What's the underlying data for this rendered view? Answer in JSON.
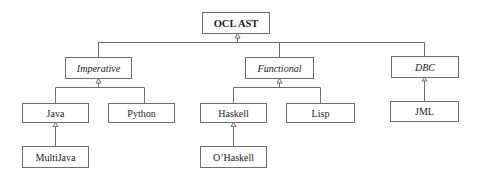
{
  "diagram": {
    "type": "class-inheritance-tree",
    "nodes": {
      "root": {
        "label": "OCL AST",
        "style": "bold"
      },
      "imperative": {
        "label": "Imperative",
        "style": "italic"
      },
      "functional": {
        "label": "Functional",
        "style": "italic"
      },
      "dbc": {
        "label": "DBC",
        "style": "italic"
      },
      "java": {
        "label": "Java"
      },
      "python": {
        "label": "Python"
      },
      "haskell": {
        "label": "Haskell"
      },
      "lisp": {
        "label": "Lisp"
      },
      "jml": {
        "label": "JML"
      },
      "multijava": {
        "label": "MultiJava"
      },
      "ohaskell": {
        "label": "O’Haskell"
      }
    },
    "edges": [
      {
        "from": "imperative",
        "to": "root",
        "kind": "generalization"
      },
      {
        "from": "functional",
        "to": "root",
        "kind": "generalization"
      },
      {
        "from": "dbc",
        "to": "root",
        "kind": "generalization"
      },
      {
        "from": "java",
        "to": "imperative",
        "kind": "generalization"
      },
      {
        "from": "python",
        "to": "imperative",
        "kind": "generalization"
      },
      {
        "from": "haskell",
        "to": "functional",
        "kind": "generalization"
      },
      {
        "from": "lisp",
        "to": "functional",
        "kind": "generalization"
      },
      {
        "from": "jml",
        "to": "dbc",
        "kind": "generalization"
      },
      {
        "from": "multijava",
        "to": "java",
        "kind": "generalization"
      },
      {
        "from": "ohaskell",
        "to": "haskell",
        "kind": "generalization"
      }
    ],
    "colors": {
      "line": "#6e6e6e",
      "text": "#222222",
      "background": "#ffffff"
    }
  }
}
